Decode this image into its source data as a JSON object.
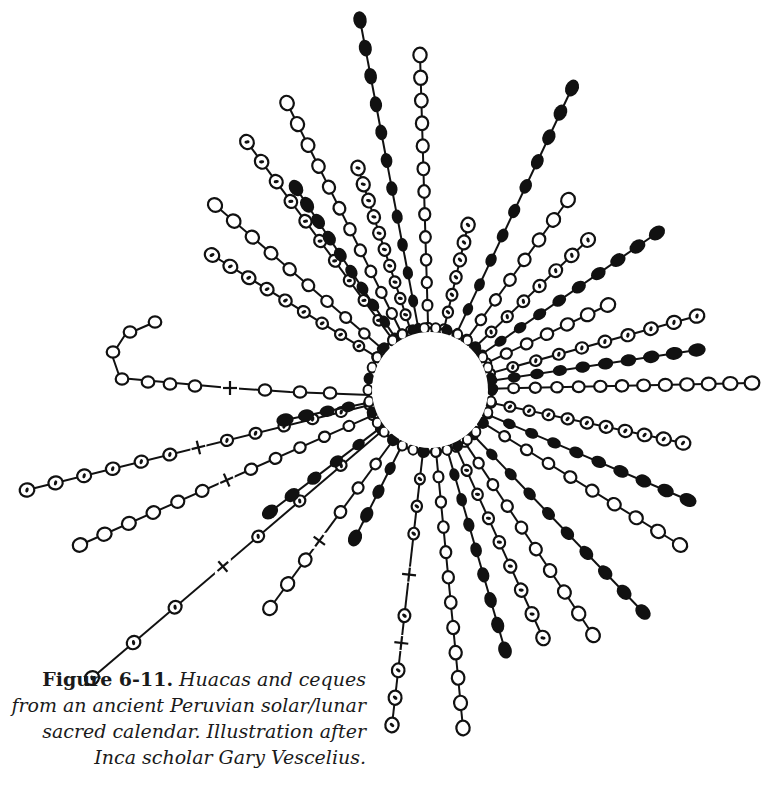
{
  "figure": {
    "label": "Figure 6-11.",
    "caption": " Huacas and ceques from an ancient Peruvian solar/lunar sacred calendar. Illustration after Inca scholar Gary Vescelius."
  },
  "diagram": {
    "center": [
      430,
      390
    ],
    "inner_radius": 62,
    "ink_color": "#111111",
    "rays": [
      {
        "end": [
          360,
          20
        ],
        "style": "filled",
        "beads": 11
      },
      {
        "end": [
          420,
          55
        ],
        "style": "open",
        "beads": 12
      },
      {
        "end": [
          572,
          88
        ],
        "style": "filled",
        "beads": 10
      },
      {
        "end": [
          468,
          225
        ],
        "style": "dotted",
        "beads": 6
      },
      {
        "end": [
          568,
          200
        ],
        "style": "open",
        "beads": 7
      },
      {
        "end": [
          588,
          240
        ],
        "style": "dotted",
        "beads": 7
      },
      {
        "end": [
          657,
          233
        ],
        "style": "filled",
        "beads": 9
      },
      {
        "end": [
          608,
          305
        ],
        "style": "open",
        "beads": 6
      },
      {
        "end": [
          697,
          316
        ],
        "style": "dotted",
        "beads": 9
      },
      {
        "end": [
          697,
          350
        ],
        "style": "filled",
        "beads": 9
      },
      {
        "end": [
          752,
          383
        ],
        "style": "open",
        "beads": 12
      },
      {
        "end": [
          683,
          443
        ],
        "style": "dotted",
        "beads": 10
      },
      {
        "end": [
          688,
          500
        ],
        "style": "filled",
        "beads": 9
      },
      {
        "end": [
          680,
          545
        ],
        "style": "open",
        "beads": 9
      },
      {
        "end": [
          643,
          612
        ],
        "style": "filled",
        "beads": 9
      },
      {
        "end": [
          593,
          635
        ],
        "style": "open",
        "beads": 9
      },
      {
        "end": [
          543,
          638
        ],
        "style": "dotted",
        "beads": 8
      },
      {
        "end": [
          505,
          650
        ],
        "style": "filled",
        "beads": 8
      },
      {
        "end": [
          463,
          728
        ],
        "style": "open",
        "beads": 11
      },
      {
        "end": [
          392,
          725
        ],
        "style": "dotted",
        "beads": 10,
        "crosses": [
          0.45,
          0.7
        ]
      },
      {
        "end": [
          355,
          538
        ],
        "style": "filled",
        "beads": 4
      },
      {
        "end": [
          270,
          608
        ],
        "style": "open",
        "beads": 7,
        "crosses": [
          0.6
        ]
      },
      {
        "end": [
          92,
          678
        ],
        "style": "dotted",
        "beads": 7,
        "crosses": [
          0.55
        ]
      },
      {
        "end": [
          80,
          545
        ],
        "style": "open",
        "beads": 12,
        "crosses": [
          0.5
        ]
      },
      {
        "end": [
          270,
          512
        ],
        "style": "filled",
        "beads": 5
      },
      {
        "end": [
          27,
          490
        ],
        "style": "dotted",
        "beads": 12,
        "crosses": [
          0.5
        ]
      },
      {
        "end": [
          285,
          420
        ],
        "style": "filled",
        "beads": 4
      },
      {
        "end": [
          212,
          255
        ],
        "style": "dotted",
        "beads": 9
      },
      {
        "end": [
          215,
          205
        ],
        "style": "open",
        "beads": 9
      },
      {
        "end": [
          247,
          142
        ],
        "style": "dotted",
        "beads": 10
      },
      {
        "end": [
          296,
          188
        ],
        "style": "filled",
        "beads": 9
      },
      {
        "end": [
          287,
          103
        ],
        "style": "open",
        "beads": 11
      },
      {
        "end": [
          358,
          168
        ],
        "style": "dotted",
        "beads": 10
      }
    ],
    "hook_ray": {
      "points": [
        [
          370,
          395
        ],
        [
          290,
          392
        ],
        [
          230,
          388
        ],
        [
          120,
          378
        ],
        [
          112,
          355
        ],
        [
          125,
          335
        ],
        [
          155,
          322
        ]
      ],
      "cross_at": [
        230,
        388
      ]
    }
  }
}
